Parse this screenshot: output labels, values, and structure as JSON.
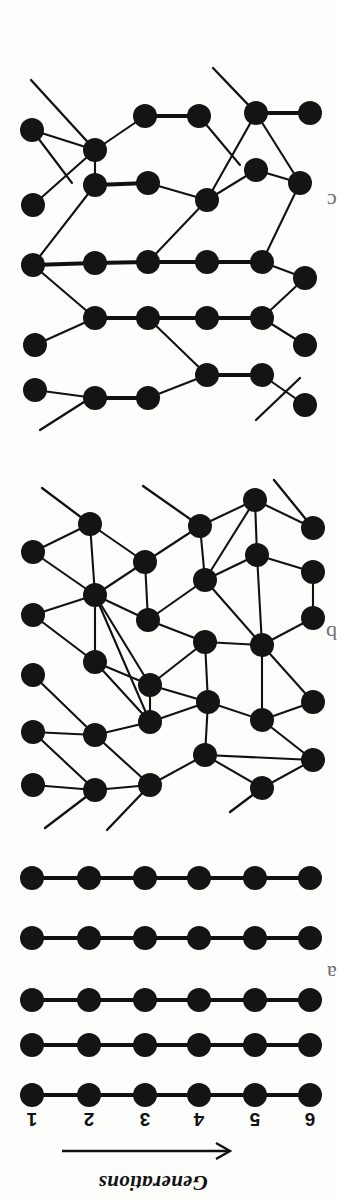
{
  "figure": {
    "orientation_note": "rotated",
    "axis": {
      "title": "Generations",
      "arrow_direction": "right",
      "tick_labels": [
        "1",
        "2",
        "3",
        "4",
        "5",
        "6"
      ],
      "tick_positions_px": [
        32,
        89,
        145,
        199,
        255,
        310
      ]
    },
    "panels": [
      {
        "id": "top",
        "label": "c",
        "kind": "rewired-network",
        "rows": 5,
        "columns": 6
      },
      {
        "id": "middle",
        "label": "b",
        "kind": "rewired-network",
        "rows": 5,
        "columns": 6
      },
      {
        "id": "bottom",
        "label": "a",
        "kind": "regular-lattice",
        "rows": 5,
        "columns": 6
      }
    ]
  },
  "chart_data": {
    "type": "diagram",
    "title": "Generations",
    "xlabel": "Generations",
    "ylabel": "",
    "x_tick_labels": [
      "1",
      "2",
      "3",
      "4",
      "5",
      "6"
    ],
    "node_color": "#141414",
    "edge_color": "#111111",
    "background_color": "#fdfdfc",
    "panels": [
      {
        "name": "bottom",
        "label": "a",
        "description": "regular lattice: five independent horizontal chains of six nodes",
        "node_count": 30,
        "columns": 6,
        "rows": 5,
        "row_y_px": [
          878,
          938,
          1000,
          1045,
          1095
        ],
        "col_x_px": [
          32,
          89,
          145,
          199,
          255,
          310
        ],
        "edges": "each row connected 1-2-3-4-5-6 in sequence"
      },
      {
        "name": "middle",
        "label": "b",
        "description": "randomly rewired network, long-range shortcut edges crossing rows",
        "node_count": 30,
        "columns": 6,
        "rows": 5
      },
      {
        "name": "top",
        "label": "c",
        "description": "partially rewired network, mixture of thick local chains and thin long-range edges",
        "node_count": 30,
        "columns": 6,
        "rows": 5
      }
    ]
  }
}
